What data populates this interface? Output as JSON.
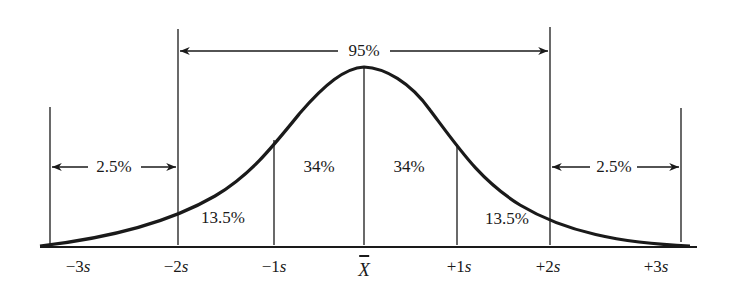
{
  "diagram": {
    "type": "normal-distribution",
    "colors": {
      "ink": "#1a1a1a",
      "background": "#ffffff"
    },
    "span_labels": {
      "center_95": "95%",
      "left_tail": "2.5%",
      "right_tail": "2.5%"
    },
    "region_labels": {
      "left_13_5": "13.5%",
      "left_34": "34%",
      "right_34": "34%",
      "right_13_5": "13.5%"
    },
    "axis_ticks": [
      {
        "label": "−3",
        "unit": "s"
      },
      {
        "label": "−2",
        "unit": "s"
      },
      {
        "label": "−1",
        "unit": "s"
      },
      {
        "label": "X",
        "unit": ""
      },
      {
        "label": "+1",
        "unit": "s"
      },
      {
        "label": "+2",
        "unit": "s"
      },
      {
        "label": "+3",
        "unit": "s"
      }
    ]
  }
}
